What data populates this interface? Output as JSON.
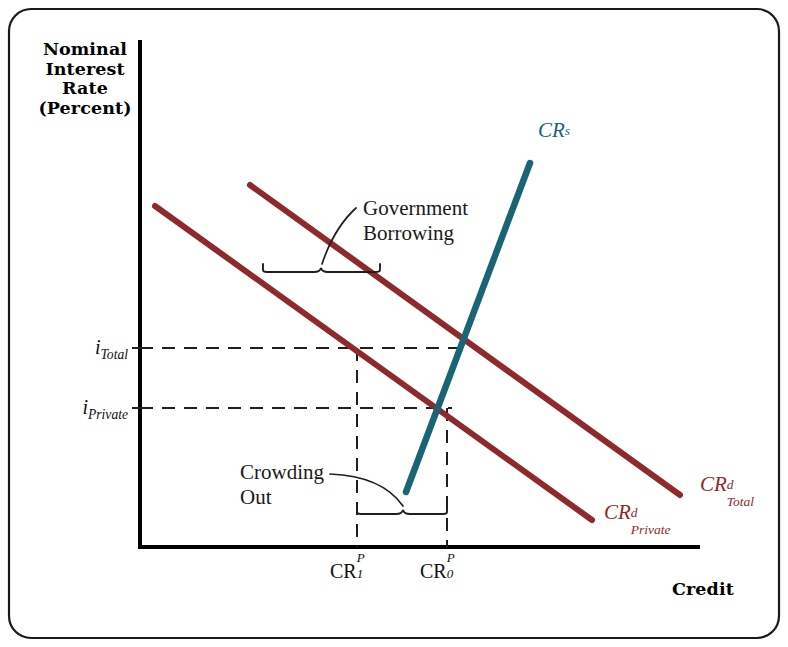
{
  "figure": {
    "type": "economics-supply-demand-diagram",
    "frame_color": "#1a1a1a",
    "background": "#ffffff"
  },
  "axes": {
    "y_title_lines": [
      "Nominal",
      "Interest",
      "Rate",
      "(Percent)"
    ],
    "x_title": "Credit",
    "axis_color": "#000000",
    "origin": {
      "x": 140,
      "y": 547
    },
    "y_top": 40,
    "x_right": 700
  },
  "curves": [
    {
      "name": "CR-d-Private",
      "label_base": "CR",
      "label_sup": "d",
      "label_sub": "Private",
      "color": "#8e2a2c",
      "role": "private-credit-demand",
      "from": {
        "x": 155,
        "y": 206
      },
      "to": {
        "x": 592,
        "y": 520
      },
      "label_pos": {
        "x": 600,
        "y": 508
      }
    },
    {
      "name": "CR-d-Total",
      "label_base": "CR",
      "label_sup": "d",
      "label_sub": "Total",
      "color": "#8e2a2c",
      "role": "total-credit-demand",
      "from": {
        "x": 250,
        "y": 185
      },
      "to": {
        "x": 680,
        "y": 495
      },
      "label_pos": {
        "x": 692,
        "y": 482
      }
    },
    {
      "name": "CR-s",
      "label_base": "CR",
      "label_sup": "s",
      "label_sub": "",
      "color": "#1b6475",
      "role": "credit-supply",
      "from": {
        "x": 406,
        "y": 492
      },
      "to": {
        "x": 530,
        "y": 163
      },
      "label_pos": {
        "x": 540,
        "y": 130
      }
    }
  ],
  "y_ticks": [
    {
      "label_base": "i",
      "label_sub": "Total",
      "value_y": 348
    },
    {
      "label_base": "i",
      "label_sub": "Private",
      "value_y": 408
    }
  ],
  "x_ticks": [
    {
      "label_base": "CR",
      "sup": "P",
      "sub": "1",
      "value_x": 357
    },
    {
      "label_base": "CR",
      "sup": "P",
      "sub": "0",
      "value_x": 447
    }
  ],
  "annotations": [
    {
      "name": "government-borrowing",
      "lines": [
        "Government",
        "Borrowing"
      ],
      "text_pos": {
        "x": 363,
        "y": 200
      },
      "brace": {
        "x1": 263,
        "x2": 380,
        "y": 270
      },
      "leader_from": {
        "x": 356,
        "y": 213
      },
      "leader_to": {
        "x": 322,
        "y": 268
      }
    },
    {
      "name": "crowding-out",
      "lines": [
        "Crowding",
        "Out"
      ],
      "text_pos": {
        "x": 243,
        "y": 472
      },
      "brace": {
        "x1": 357,
        "x2": 447,
        "y": 512
      },
      "leader_from": {
        "x": 343,
        "y": 478
      },
      "leader_to": {
        "x": 404,
        "y": 509
      }
    }
  ],
  "dashed_lines": {
    "color": "#1f1f1f",
    "horizontals": [
      {
        "name": "i-total-guide",
        "y": 348,
        "x1": 140,
        "x2": 470
      },
      {
        "name": "i-private-guide",
        "y": 408,
        "x1": 140,
        "x2": 452
      }
    ],
    "verticals": [
      {
        "name": "cr1-guide",
        "x": 357,
        "y1": 348,
        "y2": 547
      },
      {
        "name": "cr0-guide",
        "x": 447,
        "y1": 408,
        "y2": 547
      }
    ]
  }
}
